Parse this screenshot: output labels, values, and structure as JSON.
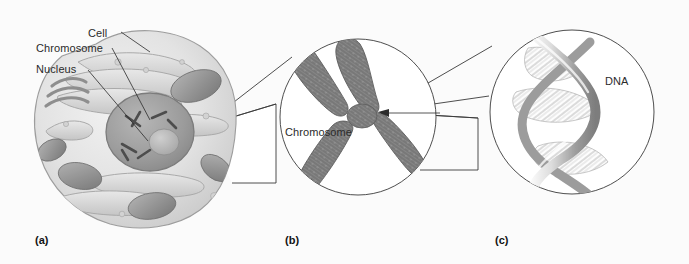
{
  "figure": {
    "background_color": "#fbfbfb",
    "line_color": "#3a3a3a",
    "text_color": "#2b2b2b",
    "panels": [
      {
        "key": "a",
        "label": "(a)",
        "subject": "cell",
        "callouts": [
          "Cell",
          "Chromosome",
          "Nucleus"
        ]
      },
      {
        "key": "b",
        "label": "(b)",
        "subject": "chromosome",
        "callouts": [
          "Chromosome"
        ]
      },
      {
        "key": "c",
        "label": "(c)",
        "subject": "dna",
        "callouts": [
          "DNA"
        ]
      }
    ]
  },
  "labels": {
    "cell": "Cell",
    "chromosome_a": "Chromosome",
    "nucleus": "Nucleus",
    "chromosome_b": "Chromosome",
    "dna": "DNA",
    "panel_a": "(a)",
    "panel_b": "(b)",
    "panel_c": "(c)"
  }
}
